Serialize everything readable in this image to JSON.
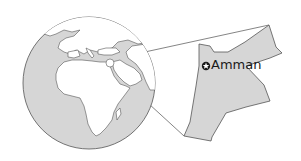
{
  "map": {
    "type": "locator-map",
    "globe_view": "Africa, Europe and Middle East hemisphere",
    "inset_country": "Jordan",
    "capital": {
      "label": "Amman",
      "marker": "star-in-circle-icon"
    },
    "colors": {
      "ocean": "#d6d6d6",
      "land": "#ffffff",
      "highlight_country": "#d6d6d6",
      "outline": "#555555",
      "connector": "#666666"
    }
  }
}
